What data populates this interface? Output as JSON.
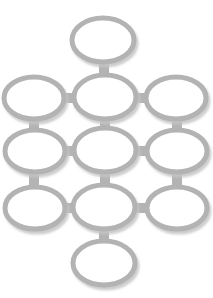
{
  "canvas": {
    "width": 213,
    "height": 298,
    "background": "#ffffff",
    "title": "Node lattice diagram"
  },
  "style": {
    "node_stroke_color": "#b3b3b3",
    "node_fill_color": "#ffffff",
    "node_stroke_width": 5,
    "edge_color": "#b3b3b3",
    "edge_thickness": 10,
    "shadow_color": "#cccccc",
    "shadow_offset_x": 2,
    "shadow_offset_y": 3
  },
  "chart_data": {
    "type": "diagram",
    "layout": "diamond-lattice",
    "node_shape": "ellipse",
    "node_count": 11,
    "edge_count": 14,
    "nodes": [
      {
        "id": "top",
        "label": "",
        "cx": 103,
        "cy": 40,
        "rx": 31,
        "ry": 22,
        "row": "top",
        "col": "center"
      },
      {
        "id": "r1-left",
        "label": "",
        "cx": 34,
        "cy": 98,
        "rx": 30,
        "ry": 21,
        "row": "upper",
        "col": "left"
      },
      {
        "id": "r1-center",
        "label": "",
        "cx": 105,
        "cy": 97,
        "rx": 31,
        "ry": 22,
        "row": "upper",
        "col": "center"
      },
      {
        "id": "r1-right",
        "label": "",
        "cx": 176,
        "cy": 98,
        "rx": 30,
        "ry": 21,
        "row": "upper",
        "col": "right"
      },
      {
        "id": "r2-left",
        "label": "",
        "cx": 35,
        "cy": 151,
        "rx": 30,
        "ry": 21,
        "row": "middle",
        "col": "left"
      },
      {
        "id": "r2-center",
        "label": "",
        "cx": 105,
        "cy": 150,
        "rx": 31,
        "ry": 22,
        "row": "middle",
        "col": "center"
      },
      {
        "id": "r2-right",
        "label": "",
        "cx": 177,
        "cy": 151,
        "rx": 30,
        "ry": 21,
        "row": "middle",
        "col": "right"
      },
      {
        "id": "r3-left",
        "label": "",
        "cx": 35,
        "cy": 208,
        "rx": 30,
        "ry": 21,
        "row": "lower",
        "col": "left"
      },
      {
        "id": "r3-center",
        "label": "",
        "cx": 104,
        "cy": 207,
        "rx": 31,
        "ry": 22,
        "row": "lower",
        "col": "center"
      },
      {
        "id": "r3-right",
        "label": "",
        "cx": 177,
        "cy": 208,
        "rx": 30,
        "ry": 21,
        "row": "lower",
        "col": "right"
      },
      {
        "id": "bottom",
        "label": "",
        "cx": 104,
        "cy": 263,
        "rx": 31,
        "ry": 22,
        "row": "bottom",
        "col": "center"
      }
    ],
    "edges": [
      {
        "from": "top",
        "to": "r1-center",
        "orientation": "vertical",
        "x": 104,
        "y1": 58,
        "y2": 79
      },
      {
        "from": "r1-left",
        "to": "r1-center",
        "orientation": "horizontal",
        "y": 98,
        "x1": 60,
        "x2": 78
      },
      {
        "from": "r1-center",
        "to": "r1-right",
        "orientation": "horizontal",
        "y": 98,
        "x1": 132,
        "x2": 150
      },
      {
        "from": "r1-left",
        "to": "r2-left",
        "orientation": "vertical",
        "x": 34,
        "y1": 115,
        "y2": 134
      },
      {
        "from": "r1-center",
        "to": "r2-center",
        "orientation": "vertical",
        "x": 105,
        "y1": 115,
        "y2": 132
      },
      {
        "from": "r1-right",
        "to": "r2-right",
        "orientation": "vertical",
        "x": 177,
        "y1": 115,
        "y2": 134
      },
      {
        "from": "r2-left",
        "to": "r2-center",
        "orientation": "horizontal",
        "y": 151,
        "x1": 61,
        "x2": 78
      },
      {
        "from": "r2-center",
        "to": "r2-right",
        "orientation": "horizontal",
        "y": 151,
        "x1": 132,
        "x2": 151
      },
      {
        "from": "r2-left",
        "to": "r3-left",
        "orientation": "vertical",
        "x": 34,
        "y1": 168,
        "y2": 191
      },
      {
        "from": "r2-center",
        "to": "r3-center",
        "orientation": "vertical",
        "x": 105,
        "y1": 168,
        "y2": 189
      },
      {
        "from": "r2-right",
        "to": "r3-right",
        "orientation": "vertical",
        "x": 177,
        "y1": 168,
        "y2": 191
      },
      {
        "from": "r3-left",
        "to": "r3-center",
        "orientation": "horizontal",
        "y": 208,
        "x1": 61,
        "x2": 77
      },
      {
        "from": "r3-center",
        "to": "r3-right",
        "orientation": "horizontal",
        "y": 208,
        "x1": 132,
        "x2": 151
      },
      {
        "from": "r3-center",
        "to": "bottom",
        "orientation": "vertical",
        "x": 104,
        "y1": 225,
        "y2": 245
      }
    ],
    "xlabel": "",
    "ylabel": "",
    "legend": [],
    "annotations": []
  }
}
